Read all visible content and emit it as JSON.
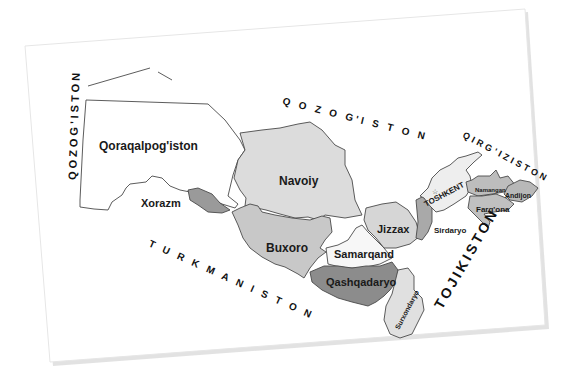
{
  "map": {
    "title": "Uzbekistan regions map",
    "colors": {
      "paper": "#ffffff",
      "light_region": "#d9d9d9",
      "mid_region": "#b4b4b4",
      "dark_region": "#8a8a8a",
      "white_region": "#f7f7f7",
      "border": "#4a4a4a"
    },
    "neighbors": {
      "qozogiston_west": "QOZOG'ISTON",
      "qozogiston_north": "Q O Z O G'I S T O N",
      "qirgiziston": "QIRG'IZISTON",
      "turkmaniston": "T U R K M A N I S T O N",
      "tojikiston": "TOJIKISTON"
    },
    "regions": {
      "qoraqalpogiston": "Qoraqalpog'iston",
      "xorazm": "Xorazm",
      "navoiy": "Navoiy",
      "buxoro": "Buxoro",
      "samarqand": "Samarqand",
      "jizzax": "Jizzax",
      "qashqadaryo": "Qashqadaryo",
      "surxondaryo": "Surxondaryo",
      "sirdaryo": "Sirdaryo",
      "toshkent": "TOSHKENT",
      "namangan": "Namangan",
      "andijon": "Andijon",
      "fargona": "Farg'ona"
    }
  }
}
